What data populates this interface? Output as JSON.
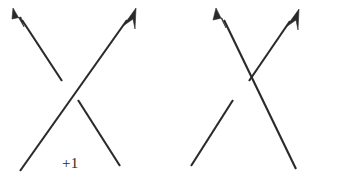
{
  "page": {
    "background_color": "#ffffff",
    "stroke_color": "#2b2a2a",
    "width": 354,
    "height": 185
  },
  "figures": [
    {
      "id": "positive-crossing",
      "label": "+1",
      "sign": "positive",
      "over_strand": {
        "name": "over-strand",
        "direction": "bottom-left-to-top-right",
        "has_arrow": true,
        "arrow_position": "top-right",
        "broken": false
      },
      "under_strand": {
        "name": "under-strand",
        "direction": "bottom-right-to-top-left",
        "has_arrow": true,
        "arrow_position": "top-left",
        "broken": true
      }
    },
    {
      "id": "negative-crossing",
      "label": "-1",
      "sign": "negative",
      "over_strand": {
        "name": "over-strand",
        "direction": "bottom-right-to-top-left",
        "has_arrow": true,
        "arrow_position": "top-left",
        "broken": false
      },
      "under_strand": {
        "name": "under-strand",
        "direction": "bottom-left-to-top-right",
        "has_arrow": true,
        "arrow_position": "top-right",
        "broken": true
      }
    }
  ]
}
